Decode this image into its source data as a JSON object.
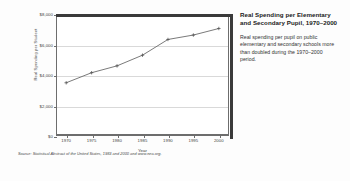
{
  "panel": {
    "title": "Real Spending per Elementary and Secondary Pupil, 1970–2000",
    "body": "Real spending per pupil on public elementary and secondary schools more than doubled during the 1970–2000 period."
  },
  "source": "Source: Statistical Abstract of the United States, 1983 and 2000 and www.nea.org.",
  "chart_data": {
    "type": "line",
    "title": "Real Spending per Elementary and Secondary Pupil, 1970–2000",
    "xlabel": "Year",
    "ylabel": "Real Spending per Student",
    "x": [
      1970,
      1975,
      1980,
      1985,
      1990,
      1995,
      2000
    ],
    "categories": [
      "1970",
      "1975",
      "1980",
      "1985",
      "1990",
      "1995",
      "2000"
    ],
    "values": [
      3490,
      4150,
      4600,
      5300,
      6330,
      6620,
      7050
    ],
    "ylim": [
      0,
      8000
    ],
    "xlim": [
      1968,
      2002
    ],
    "yticks": [
      0,
      2000,
      4000,
      6000,
      8000
    ],
    "ytick_labels": [
      "$0",
      "$2,000",
      "$4,000",
      "$6,000",
      "$8,000"
    ],
    "xticks": [
      1970,
      1975,
      1980,
      1985,
      1990,
      1995,
      2000
    ],
    "grid": true,
    "legend": false,
    "marker": "plus",
    "line_color": "#6b6b6b"
  }
}
